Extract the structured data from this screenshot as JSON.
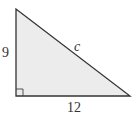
{
  "figure": {
    "type": "right-triangle",
    "fill_color": "#ececec",
    "stroke_color": "#333333",
    "vertices": {
      "top": [
        16,
        9
      ],
      "right_angle": [
        16,
        96
      ],
      "right": [
        130,
        96
      ]
    },
    "labels": {
      "vertical_leg": "9",
      "horizontal_leg": "12",
      "hypotenuse": "c"
    },
    "right_angle_marker": true
  }
}
